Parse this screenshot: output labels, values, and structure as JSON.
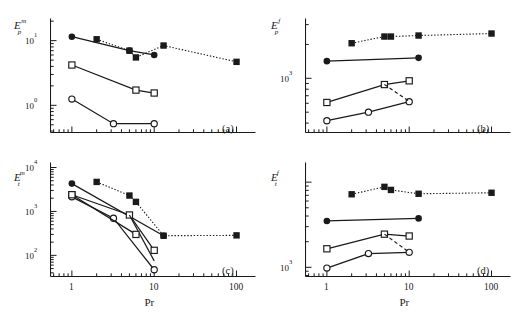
{
  "figure": {
    "width": 513,
    "height": 326,
    "background": "#ffffff",
    "ink": "#1a1a1a",
    "xlabel": "Pr",
    "xticks": [
      "1",
      "10",
      "100"
    ]
  },
  "series_style": {
    "filled_circle": {
      "marker": "filled-circle",
      "line": "solid"
    },
    "filled_square": {
      "marker": "filled-square",
      "line": "dotted"
    },
    "open_square": {
      "marker": "open-square",
      "line": "solid"
    },
    "open_circle": {
      "marker": "open-circle",
      "line": "solid"
    }
  },
  "chart_data": [
    {
      "type": "line",
      "panel": "a",
      "panel_label": "(a)",
      "title": "",
      "xlabel": "Pr",
      "ylabel": "E_p^m",
      "ylabel_base": "E",
      "ylabel_sub": "p",
      "ylabel_sup": "m",
      "xscale": "log",
      "yscale": "log",
      "xlim": [
        0.55,
        170
      ],
      "ylim": [
        0.38,
        22
      ],
      "xticks": [
        1,
        10,
        100
      ],
      "xticklabels": [
        "1",
        "10",
        "100"
      ],
      "yticks": [
        1,
        10
      ],
      "yticklabels": [
        "10^0",
        "10^1"
      ],
      "grid": false,
      "legend": "none",
      "series": [
        {
          "name": "filled_circle",
          "marker": "filled-circle",
          "line": "solid",
          "x": [
            1,
            5,
            10
          ],
          "y": [
            11.5,
            7.0,
            6.0
          ]
        },
        {
          "name": "filled_square",
          "marker": "filled-square",
          "line": "dotted",
          "x": [
            2,
            5,
            6,
            13,
            100
          ],
          "y": [
            10.5,
            7.0,
            5.5,
            8.4,
            4.7
          ]
        },
        {
          "name": "open_square",
          "marker": "open-square",
          "line": "solid",
          "x": [
            1,
            6,
            10
          ],
          "y": [
            4.2,
            1.72,
            1.55
          ]
        },
        {
          "name": "open_circle",
          "marker": "open-circle",
          "line": "solid",
          "x": [
            1,
            3.2,
            10
          ],
          "y": [
            1.25,
            0.52,
            0.52
          ]
        }
      ]
    },
    {
      "type": "line",
      "panel": "b",
      "panel_label": "(b)",
      "title": "",
      "xlabel": "Pr",
      "ylabel": "E_p^f",
      "ylabel_base": "E",
      "ylabel_sub": "p",
      "ylabel_sup": "f",
      "xscale": "log",
      "yscale": "log",
      "xlim": [
        0.55,
        170
      ],
      "ylim": [
        330,
        3400
      ],
      "xticks": [
        1,
        10,
        100
      ],
      "xticklabels": [
        "1",
        "10",
        "100"
      ],
      "yticks": [
        1000
      ],
      "yticklabels": [
        "10^3"
      ],
      "grid": false,
      "legend": "none",
      "series": [
        {
          "name": "filled_square",
          "marker": "filled-square",
          "line": "dotted",
          "x": [
            2,
            5,
            6,
            13,
            100
          ],
          "y": [
            2050,
            2350,
            2350,
            2400,
            2500
          ]
        },
        {
          "name": "filled_circle",
          "marker": "filled-circle",
          "line": "solid",
          "x": [
            1,
            13
          ],
          "y": [
            1420,
            1520
          ]
        },
        {
          "name": "open_square",
          "marker": "open-square",
          "line": "solid",
          "x": [
            1,
            5,
            10
          ],
          "y": [
            610,
            880,
            950
          ]
        },
        {
          "name": "open_circle",
          "marker": "open-circle",
          "line": "solid",
          "x": [
            1,
            3.2,
            10
          ],
          "y": [
            420,
            500,
            620
          ]
        },
        {
          "name": "open_square_branch",
          "marker": "open-square",
          "line": "dashed",
          "x": [
            5,
            10
          ],
          "y": [
            880,
            625
          ]
        }
      ]
    },
    {
      "type": "line",
      "panel": "c",
      "panel_label": "(c)",
      "title": "",
      "xlabel": "Pr",
      "ylabel": "E_t^m",
      "ylabel_base": "E",
      "ylabel_sub": "t",
      "ylabel_sup": "m",
      "xscale": "log",
      "yscale": "log",
      "xlim": [
        0.55,
        170
      ],
      "ylim": [
        33,
        13000
      ],
      "xticks": [
        1,
        10,
        100
      ],
      "xticklabels": [
        "1",
        "10",
        "100"
      ],
      "yticks": [
        100,
        1000,
        10000
      ],
      "yticklabels": [
        "10^2",
        "10^3",
        "10^4"
      ],
      "grid": false,
      "legend": "none",
      "series": [
        {
          "name": "filled_square",
          "marker": "filled-square",
          "line": "dotted",
          "x": [
            2,
            5,
            6,
            13,
            100
          ],
          "y": [
            4700,
            2300,
            1650,
            280,
            285
          ]
        },
        {
          "name": "filled_circle",
          "marker": "filled-circle",
          "line": "solid",
          "x": [
            1,
            13
          ],
          "y": [
            4300,
            280
          ]
        },
        {
          "name": "open_square",
          "marker": "open-square",
          "line": "solid",
          "x": [
            1,
            5,
            10
          ],
          "y": [
            2400,
            830,
            130
          ]
        },
        {
          "name": "open_square_branch",
          "marker": "open-square",
          "line": "solid",
          "x": [
            5,
            10
          ],
          "y": [
            830,
            75
          ]
        },
        {
          "name": "open_circle",
          "marker": "open-circle",
          "line": "solid",
          "x": [
            1,
            3.2,
            10
          ],
          "y": [
            2150,
            700,
            47
          ]
        },
        {
          "name": "open_square_low",
          "marker": "open-square",
          "line": "solid",
          "x": [
            1,
            6
          ],
          "y": [
            2400,
            300
          ]
        }
      ]
    },
    {
      "type": "line",
      "panel": "d",
      "panel_label": "(d)",
      "title": "",
      "xlabel": "Pr",
      "ylabel": "E_t^f",
      "ylabel_base": "E",
      "ylabel_sub": "t",
      "ylabel_sup": "f",
      "xscale": "log",
      "yscale": "log",
      "xlim": [
        0.55,
        170
      ],
      "ylim": [
        780,
        17000
      ],
      "xticks": [
        1,
        10,
        100
      ],
      "xticklabels": [
        "1",
        "10",
        "100"
      ],
      "yticks": [
        1000
      ],
      "yticklabels": [
        "10^3"
      ],
      "grid": false,
      "legend": "none",
      "series": [
        {
          "name": "filled_square",
          "marker": "filled-square",
          "line": "dotted",
          "x": [
            2,
            5,
            6,
            13,
            100
          ],
          "y": [
            7200,
            8800,
            8100,
            7300,
            7500
          ]
        },
        {
          "name": "filled_circle",
          "marker": "filled-circle",
          "line": "solid",
          "x": [
            1,
            13
          ],
          "y": [
            3500,
            3750
          ]
        },
        {
          "name": "open_square",
          "marker": "open-square",
          "line": "solid",
          "x": [
            1,
            5,
            10
          ],
          "y": [
            1650,
            2450,
            2330
          ]
        },
        {
          "name": "open_circle",
          "marker": "open-circle",
          "line": "solid",
          "x": [
            1,
            3.2,
            10
          ],
          "y": [
            980,
            1450,
            1500
          ]
        },
        {
          "name": "open_square_branch",
          "marker": "open-square",
          "line": "dashed",
          "x": [
            5,
            10
          ],
          "y": [
            2450,
            1500
          ]
        }
      ]
    }
  ]
}
